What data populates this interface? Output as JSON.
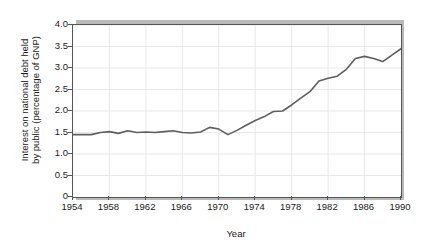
{
  "chart_data": {
    "type": "line",
    "title": "",
    "xlabel": "Year",
    "ylabel": "Interest on national debt held by public (percentage of GNP)",
    "ylabel_lines": [
      "Interest on national debt held",
      "by public (percentage of GNP)"
    ],
    "xlim": [
      1954,
      1990
    ],
    "ylim": [
      0,
      4.0
    ],
    "ytick_labels": [
      "4.0",
      "3.5",
      "3.0",
      "2.5",
      "2.0",
      "1.5",
      "1.0",
      "0.5",
      "0"
    ],
    "ytick_values": [
      4.0,
      3.5,
      3.0,
      2.5,
      2.0,
      1.5,
      1.0,
      0.5,
      0
    ],
    "xtick_labels": [
      "1954",
      "1958",
      "1962",
      "1966",
      "1970",
      "1974",
      "1978",
      "1982",
      "1986",
      "1990"
    ],
    "xtick_values": [
      1954,
      1958,
      1962,
      1966,
      1970,
      1974,
      1978,
      1982,
      1986,
      1990
    ],
    "grid": true,
    "grid_color": "#e8e8e8",
    "line_color": "#5e5e5e",
    "legend": "none",
    "x": [
      1954,
      1955,
      1956,
      1957,
      1958,
      1959,
      1960,
      1961,
      1962,
      1963,
      1964,
      1965,
      1966,
      1967,
      1968,
      1969,
      1970,
      1971,
      1972,
      1973,
      1974,
      1975,
      1976,
      1977,
      1978,
      1979,
      1980,
      1981,
      1982,
      1983,
      1984,
      1985,
      1986,
      1987,
      1988,
      1989,
      1990
    ],
    "values": [
      1.45,
      1.45,
      1.45,
      1.5,
      1.52,
      1.48,
      1.54,
      1.5,
      1.51,
      1.5,
      1.52,
      1.54,
      1.5,
      1.49,
      1.51,
      1.62,
      1.58,
      1.45,
      1.55,
      1.67,
      1.78,
      1.87,
      1.99,
      2.0,
      2.14,
      2.3,
      2.45,
      2.7,
      2.76,
      2.81,
      2.97,
      3.22,
      3.27,
      3.22,
      3.15,
      3.3,
      3.45
    ]
  }
}
